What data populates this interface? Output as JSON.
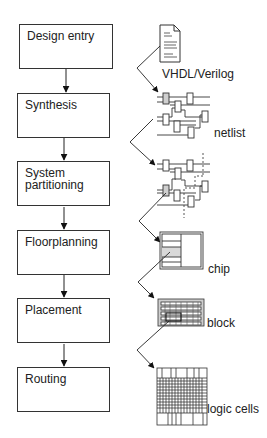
{
  "diagram": {
    "type": "ASIC design flow",
    "steps": [
      {
        "label": "Design entry",
        "top": 24
      },
      {
        "label": "Synthesis",
        "top": 93
      },
      {
        "label": "System\npartitioning",
        "top": 161
      },
      {
        "label": "Floorplanning",
        "top": 230
      },
      {
        "label": "Placement",
        "top": 298
      },
      {
        "label": "Routing",
        "top": 367
      }
    ],
    "artifacts": [
      {
        "label": "VHDL/Verilog",
        "icon": "document-icon",
        "x": 162,
        "y": 66
      },
      {
        "label": "netlist",
        "icon": "netlist-icon",
        "x": 214,
        "y": 128
      },
      {
        "label": "chip",
        "icon": "chip-floorplan-icon",
        "x": 208,
        "y": 264
      },
      {
        "label": "block",
        "icon": "placement-block-icon",
        "x": 206,
        "y": 316
      },
      {
        "label": "logic cells",
        "icon": "routed-cells-icon",
        "x": 207,
        "y": 402
      }
    ],
    "colors": {
      "line": "#222222",
      "box_border": "#333333",
      "shade": "#d9d9d9",
      "background": "#ffffff"
    }
  }
}
